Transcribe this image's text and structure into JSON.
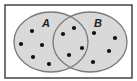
{
  "diagram": {
    "type": "venn",
    "frame": {
      "x": 5,
      "y": 5,
      "width": 127,
      "height": 73,
      "stroke": "#444444",
      "fill": "#ffffff"
    },
    "fill_color": "#d9d9d9",
    "stroke_color": "#7a7a7a",
    "dot_color": "#111111",
    "sets": [
      {
        "id": "A",
        "label": "A",
        "cx": 51,
        "cy": 42,
        "rx": 37,
        "ry": 30,
        "label_x": 42,
        "label_y": 27
      },
      {
        "id": "B",
        "label": "B",
        "cx": 90,
        "cy": 42,
        "rx": 37,
        "ry": 30,
        "label_x": 94,
        "label_y": 27
      }
    ],
    "regions": {
      "A_only": {
        "count": 5,
        "points": [
          [
            32,
            31
          ],
          [
            21,
            44
          ],
          [
            42,
            45
          ],
          [
            33,
            57
          ],
          [
            49,
            64
          ]
        ]
      },
      "A_and_B": {
        "count": 4,
        "points": [
          [
            63,
            34
          ],
          [
            74,
            28
          ],
          [
            82,
            48
          ],
          [
            69,
            55
          ]
        ]
      },
      "B_only": {
        "count": 4,
        "points": [
          [
            94,
            33
          ],
          [
            115,
            38
          ],
          [
            109,
            51
          ],
          [
            93,
            62
          ]
        ]
      }
    }
  }
}
